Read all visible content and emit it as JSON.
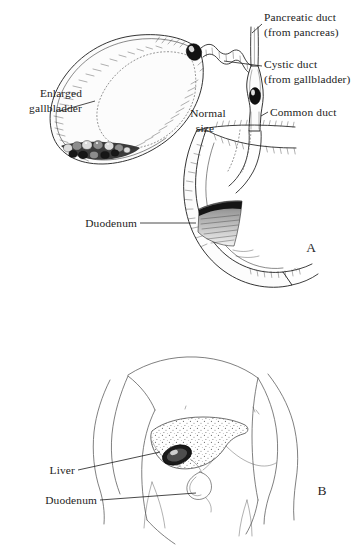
{
  "figure": {
    "background_color": "#ffffff",
    "ink_color": "#1d1d1d",
    "guide_color": "#6e6e6e"
  },
  "panels": [
    {
      "id": "A",
      "letter": "A",
      "caption": "Cutaway view of enlarged gallbladder, cystic duct, pancreatic duct, common duct and duodenum",
      "labels": [
        {
          "name": "enlarged-gallbladder",
          "lines": [
            "Enlarged",
            "gallbladder"
          ],
          "line1": "Enlarged",
          "line2": "gallbladder",
          "align": "right"
        },
        {
          "name": "normal-size",
          "lines": [
            "Normal",
            "size"
          ],
          "line1": "Normal",
          "line2": "size",
          "align": "center"
        },
        {
          "name": "pancreatic-duct",
          "lines": [
            "Pancreatic duct",
            "(from pancreas)"
          ],
          "line1": "Pancreatic duct",
          "line2": "(from pancreas)",
          "align": "left"
        },
        {
          "name": "cystic-duct",
          "lines": [
            "Cystic duct",
            "(from gallbladder)"
          ],
          "line1": "Cystic duct",
          "line2": "(from gallbladder)",
          "align": "left"
        },
        {
          "name": "common-duct",
          "lines": [
            "Common duct"
          ],
          "line1": "Common duct",
          "line2": "",
          "align": "left"
        },
        {
          "name": "duodenum",
          "lines": [
            "Duodenum"
          ],
          "line1": "Duodenum",
          "line2": "",
          "align": "right"
        }
      ]
    },
    {
      "id": "B",
      "letter": "B",
      "caption": "Anterior torso showing position of liver, gallbladder and duodenum",
      "labels": [
        {
          "name": "liver",
          "lines": [
            "Liver"
          ],
          "line1": "Liver",
          "line2": "",
          "align": "right"
        },
        {
          "name": "duodenum",
          "lines": [
            "Duodenum"
          ],
          "line1": "Duodenum",
          "line2": "",
          "align": "right"
        }
      ]
    }
  ]
}
